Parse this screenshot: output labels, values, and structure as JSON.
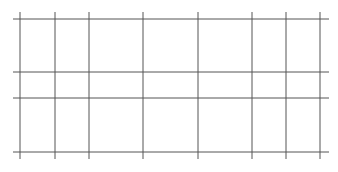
{
  "diagram": {
    "type": "grid",
    "line_color": "#555555",
    "background_color": "#ffffff",
    "vertical_line_count": 8,
    "horizontal_line_count": 4
  }
}
